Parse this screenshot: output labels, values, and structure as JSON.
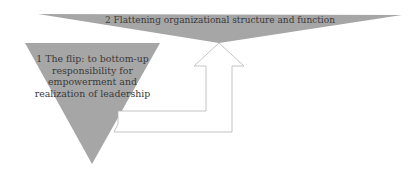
{
  "diagram": {
    "top_triangle": {
      "label": "2 Flattening organizational structure and function",
      "fill": "#a6a6a6"
    },
    "left_triangle": {
      "label": "1 The flip: to bottom-up responsibility for empowerment and realization of leadership",
      "fill": "#a6a6a6"
    },
    "arrow": {
      "direction": "up",
      "stroke": "#b5b5b5",
      "fill": "#ffffff"
    }
  }
}
